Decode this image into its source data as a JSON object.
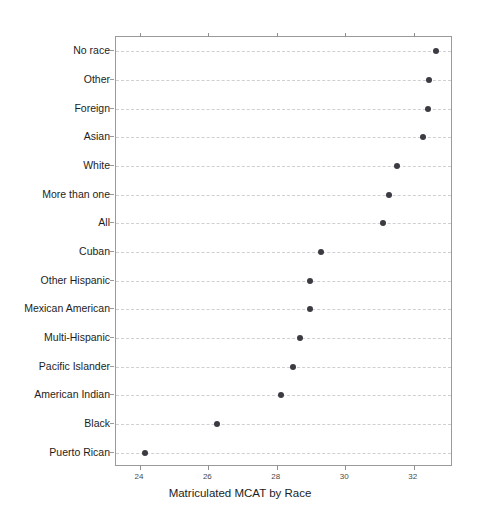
{
  "chart_data": {
    "type": "scatter",
    "title": "",
    "xlabel": "Matriculated MCAT by Race",
    "ylabel": "",
    "xlim": [
      23.3,
      33.15
    ],
    "xticks": [
      24,
      26,
      28,
      30,
      32
    ],
    "xtick_labels": [
      "24",
      "26",
      "28",
      "30",
      "32"
    ],
    "grid": true,
    "grid_style": "dashed-horizontal",
    "legend": "none",
    "marker": "filled-circle",
    "marker_color": "#3b3b42",
    "categories": [
      "No race",
      "Other",
      "Foreign",
      "Asian",
      "White",
      "More than one",
      "All",
      "Cuban",
      "Other Hispanic",
      "Mexican American",
      "Multi-Hispanic",
      "Pacific Islander",
      "American Indian",
      "Black",
      "Puerto Rican"
    ],
    "values": [
      32.66,
      32.46,
      32.41,
      32.27,
      31.5,
      31.29,
      31.09,
      29.3,
      28.97,
      28.96,
      28.68,
      28.48,
      28.11,
      26.24,
      24.14
    ]
  },
  "axis": {
    "x_title": "Matriculated MCAT by Race"
  },
  "style": {
    "frame_color": "#9a9a9a",
    "grid_color": "#cfcfd4",
    "point_color": "#3b3b42",
    "background": "#ffffff",
    "text_color": "#1d1d1d"
  }
}
